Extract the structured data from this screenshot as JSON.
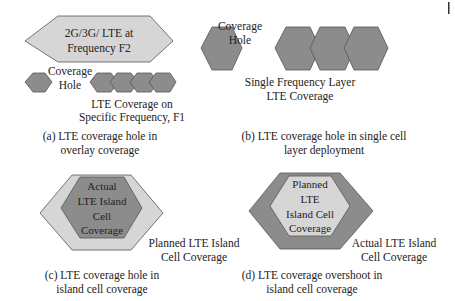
{
  "colors": {
    "dark_hex": "#8c8c8c",
    "light_hex": "#d6d6d6",
    "stroke": "#555555",
    "text": "#222222"
  },
  "panel_a": {
    "overlay_label_line1": "2G/3G/ LTE at",
    "overlay_label_line2": "Frequency F2",
    "hole_label_line1": "Coverage",
    "hole_label_line2": "Hole",
    "cells_label_line1": "LTE Coverage on",
    "cells_label_line2": "Specific Frequency, F1",
    "caption_line1": "(a) LTE coverage hole in",
    "caption_line2": "overlay coverage"
  },
  "panel_b": {
    "hole_label_line1": "Coverage",
    "hole_label_line2": "Hole",
    "cells_label_line1": "Single Frequency Layer",
    "cells_label_line2": "LTE Coverage",
    "caption_line1": "(b) LTE coverage hole in single cell",
    "caption_line2": "layer deployment"
  },
  "panel_c": {
    "inner_line1": "Actual",
    "inner_line2": "LTE Island",
    "inner_line3": "Cell",
    "inner_line4": "Coverage",
    "outer_label_line1": "Planned LTE Island",
    "outer_label_line2": "Cell Coverage",
    "caption_line1": "(c) LTE coverage hole in",
    "caption_line2": "island cell coverage"
  },
  "panel_d": {
    "inner_line1": "Planned",
    "inner_line2": "LTE",
    "inner_line3": "Island Cell",
    "inner_line4": "Coverage",
    "outer_label_line1": "Actual LTE Island",
    "outer_label_line2": "Cell Coverage",
    "caption_line1": "(d) LTE coverage overshoot in",
    "caption_line2": "island cell coverage"
  }
}
